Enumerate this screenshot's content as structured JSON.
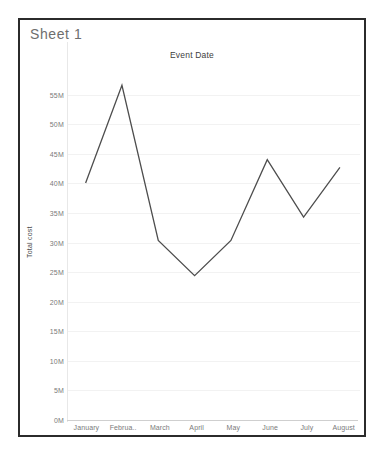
{
  "worksheet": {
    "sheet_name": "Sheet 1"
  },
  "chart_data": {
    "type": "line",
    "title": "Event Date",
    "xlabel": "",
    "ylabel": "Total cost",
    "categories": [
      "January",
      "Februa..",
      "March",
      "April",
      "May",
      "June",
      "July",
      "August"
    ],
    "values": [
      39.8,
      56.5,
      30.0,
      24.0,
      30.0,
      43.8,
      34.0,
      42.5
    ],
    "ylim": [
      0,
      57.5
    ],
    "y_ticks": [
      0,
      5,
      10,
      15,
      20,
      25,
      30,
      35,
      40,
      45,
      50,
      55
    ],
    "y_tick_labels": [
      "0M",
      "5M",
      "10M",
      "15M",
      "20M",
      "25M",
      "30M",
      "35M",
      "40M",
      "45M",
      "50M",
      "55M"
    ],
    "value_unit": "M",
    "grid": true,
    "legend": "none",
    "series": [
      {
        "name": "Total cost",
        "color": "#4d4d4d",
        "values": [
          39.8,
          56.5,
          30.0,
          24.0,
          30.0,
          43.8,
          34.0,
          42.5
        ]
      }
    ]
  },
  "colors": {
    "frame_border": "#2b2b2b",
    "line": "#4d4d4d",
    "gridline": "#f2f2f2",
    "axis": "#cfcfcf",
    "tick_text": "#7a7a7a",
    "sheet_title_text": "#6e6e6e",
    "chart_title_text": "#3d3d3d",
    "background": "#ffffff"
  }
}
